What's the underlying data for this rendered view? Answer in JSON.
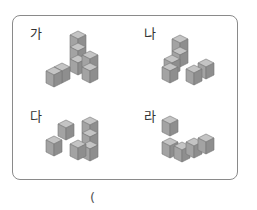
{
  "figures": [
    {
      "label": "가"
    },
    {
      "label": "나"
    },
    {
      "label": "다"
    },
    {
      "label": "라"
    }
  ],
  "answer": {
    "open_paren": "("
  },
  "colors": {
    "top": "#bdbdbd",
    "left": "#9e9e9e",
    "right": "#8a8a8a",
    "edge": "#6e6e6e",
    "border": "#8a8a8a"
  }
}
